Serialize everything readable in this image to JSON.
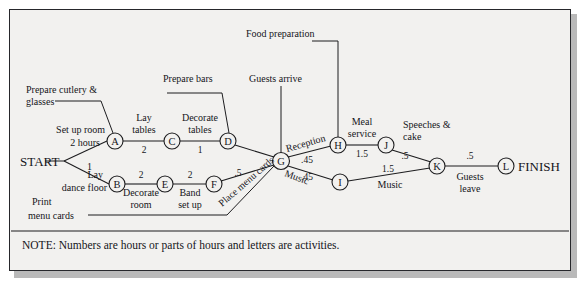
{
  "figure": {
    "type": "network-activity-diagram",
    "terminals": {
      "start": "START",
      "finish": "FINISH"
    },
    "note": "NOTE: Numbers are hours or parts of hours and letters are activities.",
    "colors": {
      "ink": "#15151a",
      "paper": "#f2f1ef",
      "frame": "#26272b",
      "shadow": "#b9b9b9"
    }
  },
  "nodes": [
    {
      "id": "A",
      "label": "A",
      "x": 115,
      "y": 141
    },
    {
      "id": "B",
      "label": "B",
      "x": 117,
      "y": 184
    },
    {
      "id": "C",
      "label": "C",
      "x": 172,
      "y": 141
    },
    {
      "id": "D",
      "label": "D",
      "x": 228,
      "y": 141
    },
    {
      "id": "E",
      "label": "E",
      "x": 165,
      "y": 184
    },
    {
      "id": "F",
      "label": "F",
      "x": 214,
      "y": 184
    },
    {
      "id": "G",
      "label": "G",
      "x": 281,
      "y": 161
    },
    {
      "id": "H",
      "label": "H",
      "x": 338,
      "y": 145
    },
    {
      "id": "I",
      "label": "I",
      "x": 340,
      "y": 182
    },
    {
      "id": "J",
      "label": "J",
      "x": 386,
      "y": 145
    },
    {
      "id": "K",
      "label": "K",
      "x": 437,
      "y": 166
    },
    {
      "id": "L",
      "label": "L",
      "x": 506,
      "y": 166
    }
  ],
  "edges": [
    {
      "from": "START",
      "to": "A",
      "duration": "2",
      "activity": "Set up room"
    },
    {
      "from": "START",
      "to": "B",
      "duration": "1",
      "activity": "Lay dance floor"
    },
    {
      "from": "A",
      "to": "C",
      "duration": "2",
      "activity": "Lay tables"
    },
    {
      "from": "C",
      "to": "D",
      "duration": "1",
      "activity": "Decorate tables"
    },
    {
      "from": "B",
      "to": "E",
      "duration": "2",
      "activity": "Decorate room"
    },
    {
      "from": "E",
      "to": "F",
      "duration": "2",
      "activity": "Band set up"
    },
    {
      "from": "D",
      "to": "G",
      "duration": "",
      "activity": ""
    },
    {
      "from": "F",
      "to": "G",
      "duration": ".5",
      "activity": "Place menu cards"
    },
    {
      "from": "G",
      "to": "H",
      "duration": ".45",
      "activity": "Reception"
    },
    {
      "from": "G",
      "to": "I",
      "duration": ".45",
      "activity": "Music"
    },
    {
      "from": "H",
      "to": "J",
      "duration": "1.5",
      "activity": "Meal service"
    },
    {
      "from": "I",
      "to": "K",
      "duration": "1.5",
      "activity": "Music"
    },
    {
      "from": "J",
      "to": "K",
      "duration": ".5",
      "activity": "Speeches & cake"
    },
    {
      "from": "K",
      "to": "L",
      "duration": ".5",
      "activity": "Guests leave"
    }
  ],
  "labels": {
    "set_up_room_line1": "Set up room",
    "set_up_room_line2": "2 hours",
    "set_up_room_duration": "2",
    "lay_dance_floor_line1": "Lay",
    "lay_dance_floor_line2": "dance floor",
    "lay_dance_floor_duration": "1",
    "lay_tables_line1": "Lay",
    "lay_tables_line2": "tables",
    "lay_tables_duration": "2",
    "decorate_tables_line1": "Decorate",
    "decorate_tables_line2": "tables",
    "decorate_tables_duration": "1",
    "decorate_room_line1": "Decorate",
    "decorate_room_line2": "room",
    "decorate_room_duration": "2",
    "band_set_up_line1": "Band",
    "band_set_up_line2": "set up",
    "band_set_up_duration": "2",
    "place_menu_cards": "Place menu cards",
    "place_menu_cards_duration": ".5",
    "reception": "Reception",
    "reception_duration": ".45",
    "music_g_i": "Music",
    "music_g_i_duration": ".45",
    "meal_service_line1": "Meal",
    "meal_service_line2": "service",
    "meal_service_duration": "1.5",
    "music_i_k": "Music",
    "music_i_k_duration": "1.5",
    "speeches_cake_line1": "Speeches &",
    "speeches_cake_line2": "cake",
    "speeches_cake_duration": ".5",
    "guests_leave_line1": "Guests",
    "guests_leave_line2": "leave",
    "guests_leave_duration": ".5",
    "prepare_cutlery_line1": "Prepare cutlery &",
    "prepare_cutlery_line2": "glasses",
    "prepare_bars": "Prepare bars",
    "food_preparation": "Food preparation",
    "guests_arrive": "Guests arrive",
    "print_menu_cards_line1": "Print",
    "print_menu_cards_line2": "menu cards"
  }
}
